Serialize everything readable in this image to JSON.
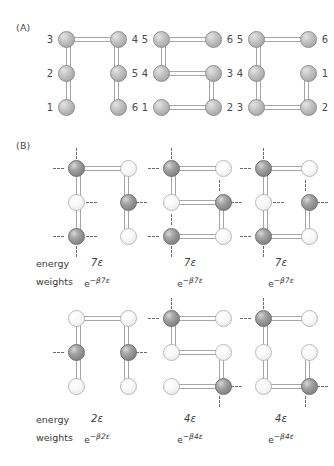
{
  "figure": {
    "panels": [
      {
        "label": "(A)",
        "name": "panel-a"
      },
      {
        "label": "(B)",
        "name": "panel-b"
      }
    ]
  },
  "colors": {
    "bead_plain": "#b0b0b0",
    "bead_dark": "#8c8c8c",
    "bead_light": "#efefef",
    "bond": "#a6a6a6",
    "dash": "#6b6b6b",
    "text": "#3a3a3a",
    "background": "#ffffff"
  },
  "panel_a": {
    "label": "(A)",
    "conformations": [
      {
        "name": "conformation-u-shape",
        "shape": "U",
        "bead_numbers": {
          "top_left": "3",
          "top_right": "4",
          "mid_left": "2",
          "mid_right": "5",
          "bottom_left": "1",
          "bottom_right": "6"
        }
      },
      {
        "name": "conformation-s-shape",
        "shape": "S",
        "bead_numbers": {
          "top_left": "5",
          "top_right": "6",
          "mid_left": "4",
          "mid_right": "3",
          "bottom_left": "1",
          "bottom_right": "2"
        }
      },
      {
        "name": "conformation-c-shape",
        "shape": "C",
        "bead_numbers": {
          "top_left": "5",
          "top_right": "6",
          "mid_left": "4",
          "mid_right": "1",
          "bottom_left": "3",
          "bottom_right": "2"
        }
      }
    ]
  },
  "panel_b": {
    "label": "(B)",
    "row_labels": {
      "energy": "energy",
      "weights": "weights"
    },
    "rows": [
      {
        "name": "row-seven-epsilon",
        "structures": [
          {
            "name": "structure-b1",
            "shape": "U",
            "bead_types": {
              "top_left": "dark",
              "top_right": "light",
              "mid_left": "light",
              "mid_right": "dark",
              "bottom_left": "dark",
              "bottom_right": "light"
            },
            "energy": "7ε",
            "weight_base": "e",
            "weight_exponent": "−β7ε"
          },
          {
            "name": "structure-b2",
            "shape": "S",
            "bead_types": {
              "top_left": "dark",
              "top_right": "light",
              "mid_left": "light",
              "mid_right": "dark",
              "bottom_left": "dark",
              "bottom_right": "light"
            },
            "energy": "7ε",
            "weight_base": "e",
            "weight_exponent": "−β7ε"
          },
          {
            "name": "structure-b3",
            "shape": "C",
            "bead_types": {
              "top_left": "dark",
              "top_right": "light",
              "mid_left": "light",
              "mid_right": "dark",
              "bottom_left": "dark",
              "bottom_right": "light"
            },
            "energy": "7ε",
            "weight_base": "e",
            "weight_exponent": "−β7ε"
          }
        ]
      },
      {
        "name": "row-two-and-four-epsilon",
        "structures": [
          {
            "name": "structure-b4",
            "shape": "U",
            "bead_types": {
              "top_left": "light",
              "top_right": "light",
              "mid_left": "dark",
              "mid_right": "dark",
              "bottom_left": "light",
              "bottom_right": "light"
            },
            "energy": "2ε",
            "weight_base": "e",
            "weight_exponent": "−β2ε"
          },
          {
            "name": "structure-b5",
            "shape": "S",
            "bead_types": {
              "top_left": "dark",
              "top_right": "light",
              "mid_left": "light",
              "mid_right": "light",
              "bottom_left": "light",
              "bottom_right": "dark"
            },
            "energy": "4ε",
            "weight_base": "e",
            "weight_exponent": "−β4ε"
          },
          {
            "name": "structure-b6",
            "shape": "C",
            "bead_types": {
              "top_left": "dark",
              "top_right": "light",
              "mid_left": "light",
              "mid_right": "light",
              "bottom_left": "light",
              "bottom_right": "dark"
            },
            "energy": "4ε",
            "weight_base": "e",
            "weight_exponent": "−β4ε"
          }
        ]
      }
    ]
  }
}
